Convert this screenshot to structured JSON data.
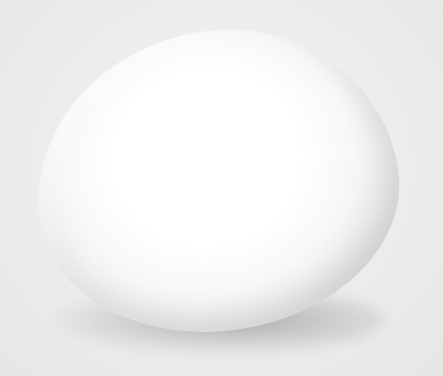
{
  "image": {
    "subject": "egg",
    "description": "A single white egg on a light gray background with a soft shadow beneath it",
    "colors": {
      "background": "#ebebeb",
      "egg_highlight": "#ffffff",
      "egg_edge": "#c4c4c4",
      "shadow": "#8a8a8a"
    }
  }
}
